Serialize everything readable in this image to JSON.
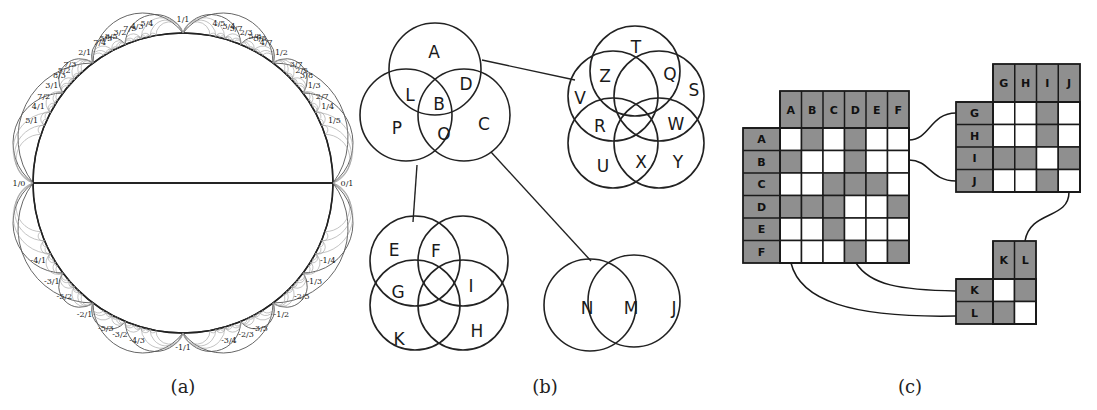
{
  "captions": {
    "a": "(a)",
    "b": "(b)",
    "c": "(c)"
  },
  "panel_a": {
    "description": "Farey tessellation (Ford-circle style) on hyperbolic disk",
    "labels_top": [
      "1/0",
      "5/1",
      "4/1",
      "7/2",
      "3/1",
      "8/3",
      "5/2",
      "7/3",
      "2/1",
      "7/4",
      "5/3",
      "8/5",
      "3/2",
      "7/5",
      "4/3",
      "5/4",
      "1/1",
      "4/5",
      "3/4",
      "5/7",
      "2/3",
      "5/8",
      "3/5",
      "4/7",
      "1/2",
      "3/7",
      "2/5",
      "3/8",
      "1/3",
      "2/7",
      "1/4",
      "1/5",
      "0/1"
    ],
    "labels_bottom": [
      "1/0",
      "-4/1",
      "-3/1",
      "-5/2",
      "-2/1",
      "-5/3",
      "-3/2",
      "-4/3",
      "-1/1",
      "-3/4",
      "-2/3",
      "-3/5",
      "-1/2",
      "-2/5",
      "-1/3",
      "-1/4",
      "0/1"
    ]
  },
  "panel_b": {
    "groups": [
      {
        "id": "g1",
        "labels": [
          "A",
          "L",
          "B",
          "D",
          "P",
          "O",
          "C"
        ]
      },
      {
        "id": "g2",
        "labels": [
          "T",
          "Z",
          "Q",
          "V",
          "S",
          "R",
          "W",
          "U",
          "X",
          "Y"
        ]
      },
      {
        "id": "g3",
        "labels": [
          "E",
          "F",
          "G",
          "I",
          "K",
          "H"
        ]
      },
      {
        "id": "g4",
        "labels": [
          "N",
          "M",
          "J"
        ]
      }
    ],
    "links": [
      [
        "g1",
        "g2"
      ],
      [
        "g1",
        "g3"
      ],
      [
        "g1",
        "g4"
      ]
    ]
  },
  "panel_c": {
    "matrices": [
      {
        "id": "m1",
        "headers": [
          "A",
          "B",
          "C",
          "D",
          "E",
          "F"
        ],
        "cells": [
          [
            0,
            1,
            0,
            1,
            0,
            0
          ],
          [
            1,
            0,
            0,
            1,
            0,
            0
          ],
          [
            0,
            0,
            1,
            1,
            1,
            0
          ],
          [
            1,
            1,
            1,
            0,
            0,
            1
          ],
          [
            0,
            0,
            1,
            0,
            0,
            0
          ],
          [
            0,
            0,
            0,
            1,
            0,
            1
          ]
        ]
      },
      {
        "id": "m2",
        "headers": [
          "G",
          "H",
          "I",
          "J"
        ],
        "cells": [
          [
            0,
            0,
            1,
            0
          ],
          [
            0,
            0,
            1,
            0
          ],
          [
            1,
            1,
            0,
            1
          ],
          [
            0,
            0,
            1,
            0
          ]
        ]
      },
      {
        "id": "m3",
        "headers": [
          "K",
          "L"
        ],
        "cells": [
          [
            0,
            1
          ],
          [
            1,
            0
          ]
        ]
      }
    ],
    "colors": {
      "filled": "#8f8f8f",
      "empty": "#ffffff",
      "header": "#8f8f8f",
      "line": "#1a1a1a"
    }
  }
}
